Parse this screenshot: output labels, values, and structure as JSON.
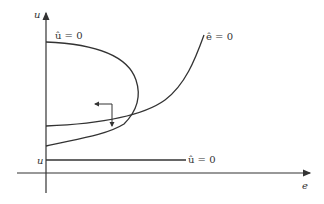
{
  "diagram": {
    "type": "phase-diagram",
    "axes": {
      "x_label": "e",
      "y_label": "u"
    },
    "curves": [
      {
        "id": "u-dot-nullcline",
        "label": "û = 0",
        "shape": "parabola opening left"
      },
      {
        "id": "e-dot-nullcline",
        "label": "ê = 0",
        "shape": "increasing convex curve"
      },
      {
        "id": "u-bar-line",
        "label": "û = 0",
        "shape": "horizontal line"
      }
    ],
    "level_label": "u",
    "direction_arrow": {
      "horizontal": "left",
      "vertical": "down"
    }
  },
  "colors": {
    "line": "#333333",
    "background": "#ffffff"
  }
}
